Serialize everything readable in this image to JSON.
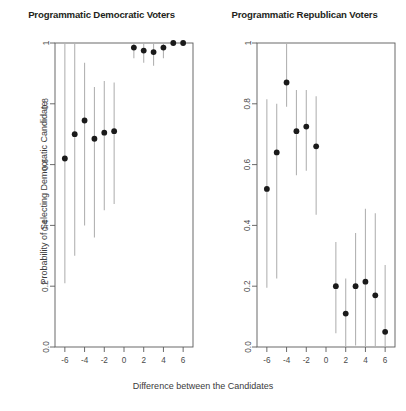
{
  "figure": {
    "xlabel": "Difference between the Candidates",
    "ylabel": "Probability of Selecting Democratic Candidate"
  },
  "panels": [
    {
      "title": "Programmatic Democratic Voters"
    },
    {
      "title": "Programmatic Republican Voters"
    }
  ],
  "chart_data": [
    {
      "type": "scatter",
      "title": "Programmatic Democratic Voters",
      "xlabel": "Difference between the Candidates",
      "ylabel": "Probability of Selecting Democratic Candidate",
      "xlim": [
        -7,
        7
      ],
      "ylim": [
        0.0,
        1.0
      ],
      "xticks": [
        -6,
        -4,
        -2,
        0,
        2,
        4,
        6
      ],
      "xticklabels": [
        "-6",
        "-4",
        "-2",
        "0",
        "2",
        "4",
        "6"
      ],
      "yticks": [
        0.0,
        0.2,
        0.4,
        0.6,
        0.8,
        1.0
      ],
      "yticklabels": [
        "0.0",
        "0.2",
        "0.4",
        "0.6",
        "0.8",
        "1"
      ],
      "grid": false,
      "legend": "none",
      "marker": "filled-circle",
      "errorbar": "vertical-line",
      "x": [
        -6,
        -5,
        -4,
        -3,
        -2,
        -1,
        1,
        2,
        3,
        4,
        5,
        6
      ],
      "values": [
        0.62,
        0.7,
        0.745,
        0.685,
        0.705,
        0.71,
        0.985,
        0.975,
        0.97,
        0.985,
        1.0,
        1.0
      ],
      "ci_low": [
        0.21,
        0.3,
        0.4,
        0.36,
        0.45,
        0.47,
        0.95,
        0.935,
        0.925,
        0.95,
        0.995,
        0.995
      ],
      "ci_high": [
        1.0,
        1.0,
        0.935,
        0.855,
        0.875,
        0.87,
        1.0,
        1.0,
        1.0,
        1.0,
        1.0,
        1.0
      ]
    },
    {
      "type": "scatter",
      "title": "Programmatic Republican Voters",
      "xlabel": "Difference between the Candidates",
      "ylabel": "Probability of Selecting Democratic Candidate",
      "xlim": [
        -7,
        7
      ],
      "ylim": [
        0.0,
        1.0
      ],
      "xticks": [
        -6,
        -4,
        -2,
        0,
        2,
        4,
        6
      ],
      "xticklabels": [
        "-6",
        "-4",
        "-2",
        "0",
        "2",
        "4",
        "6"
      ],
      "yticks": [
        0.0,
        0.2,
        0.4,
        0.6,
        0.8,
        1.0
      ],
      "yticklabels": [
        "0.0",
        "0.2",
        "0.4",
        "0.6",
        "0.8",
        "1"
      ],
      "grid": false,
      "legend": "none",
      "marker": "filled-circle",
      "errorbar": "vertical-line",
      "x": [
        -6,
        -5,
        -4,
        -3,
        -2,
        -1,
        1,
        2,
        3,
        4,
        5,
        6
      ],
      "values": [
        0.52,
        0.64,
        0.87,
        0.71,
        0.725,
        0.66,
        0.2,
        0.11,
        0.2,
        0.215,
        0.17,
        0.05
      ],
      "ci_low": [
        0.195,
        0.225,
        0.79,
        0.565,
        0.58,
        0.435,
        0.045,
        0.0,
        0.005,
        0.0,
        0.0,
        0.0
      ],
      "ci_high": [
        0.815,
        0.8,
        1.0,
        0.845,
        0.845,
        0.825,
        0.345,
        0.225,
        0.375,
        0.455,
        0.44,
        0.27
      ]
    }
  ]
}
